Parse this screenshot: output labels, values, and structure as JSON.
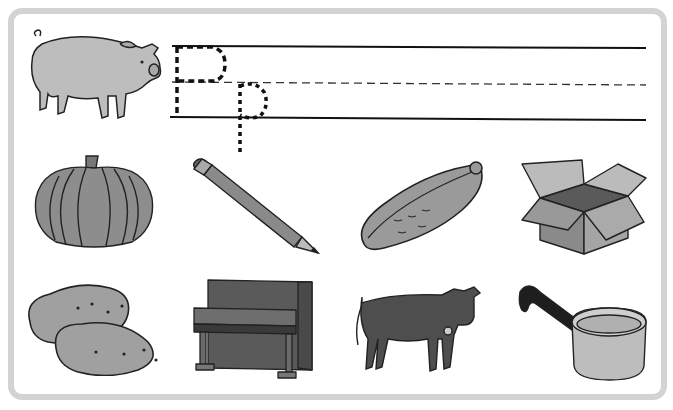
{
  "worksheet": {
    "letter_upper": "P",
    "letter_lower": "p",
    "header_picture": "pig",
    "pictures": [
      {
        "name": "pumpkin",
        "starts_with_letter": true
      },
      {
        "name": "pencil",
        "starts_with_letter": true
      },
      {
        "name": "pickle",
        "starts_with_letter": true
      },
      {
        "name": "box",
        "starts_with_letter": false
      },
      {
        "name": "potatoes",
        "starts_with_letter": true
      },
      {
        "name": "piano",
        "starts_with_letter": true
      },
      {
        "name": "cow",
        "starts_with_letter": false
      },
      {
        "name": "pan",
        "starts_with_letter": true
      }
    ]
  },
  "colors": {
    "frame": "#d3d3d3",
    "ink": "#111111"
  }
}
